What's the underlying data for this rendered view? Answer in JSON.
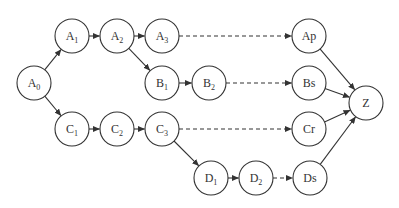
{
  "diagram": {
    "type": "directed-graph",
    "style": {
      "stroke_color": "#333333",
      "background": "#ffffff",
      "node_radius": 17
    },
    "nodes": [
      {
        "id": "A0",
        "base": "A",
        "sub": "0",
        "x": 34,
        "y": 83
      },
      {
        "id": "A1",
        "base": "A",
        "sub": "1",
        "x": 72,
        "y": 36
      },
      {
        "id": "A2",
        "base": "A",
        "sub": "2",
        "x": 117,
        "y": 36
      },
      {
        "id": "A3",
        "base": "A",
        "sub": "3",
        "x": 162,
        "y": 36
      },
      {
        "id": "B1",
        "base": "B",
        "sub": "1",
        "x": 162,
        "y": 83
      },
      {
        "id": "B2",
        "base": "B",
        "sub": "2",
        "x": 209,
        "y": 83
      },
      {
        "id": "C1",
        "base": "C",
        "sub": "1",
        "x": 72,
        "y": 129
      },
      {
        "id": "C2",
        "base": "C",
        "sub": "2",
        "x": 117,
        "y": 129
      },
      {
        "id": "C3",
        "base": "C",
        "sub": "3",
        "x": 162,
        "y": 129
      },
      {
        "id": "D1",
        "base": "D",
        "sub": "1",
        "x": 211,
        "y": 178
      },
      {
        "id": "D2",
        "base": "D",
        "sub": "2",
        "x": 256,
        "y": 178
      },
      {
        "id": "Ap",
        "base": "Ap",
        "sub": "",
        "x": 309,
        "y": 36
      },
      {
        "id": "Bs",
        "base": "Bs",
        "sub": "",
        "x": 309,
        "y": 83
      },
      {
        "id": "Cr",
        "base": "Cr",
        "sub": "",
        "x": 309,
        "y": 129
      },
      {
        "id": "Ds",
        "base": "Ds",
        "sub": "",
        "x": 310,
        "y": 178
      },
      {
        "id": "Z",
        "base": "Z",
        "sub": "",
        "x": 366,
        "y": 103
      }
    ],
    "edges": [
      {
        "from": "A0",
        "to": "A1",
        "style": "solid"
      },
      {
        "from": "A0",
        "to": "C1",
        "style": "solid"
      },
      {
        "from": "A1",
        "to": "A2",
        "style": "solid"
      },
      {
        "from": "A2",
        "to": "A3",
        "style": "solid"
      },
      {
        "from": "A2",
        "to": "B1",
        "style": "solid"
      },
      {
        "from": "A3",
        "to": "Ap",
        "style": "dashed"
      },
      {
        "from": "B1",
        "to": "B2",
        "style": "solid"
      },
      {
        "from": "B2",
        "to": "Bs",
        "style": "dashed"
      },
      {
        "from": "C1",
        "to": "C2",
        "style": "solid"
      },
      {
        "from": "C2",
        "to": "C3",
        "style": "solid"
      },
      {
        "from": "C3",
        "to": "Cr",
        "style": "dashed"
      },
      {
        "from": "C3",
        "to": "D1",
        "style": "solid"
      },
      {
        "from": "D1",
        "to": "D2",
        "style": "solid"
      },
      {
        "from": "D2",
        "to": "Ds",
        "style": "dashed"
      },
      {
        "from": "Ap",
        "to": "Z",
        "style": "solid"
      },
      {
        "from": "Bs",
        "to": "Z",
        "style": "solid"
      },
      {
        "from": "Cr",
        "to": "Z",
        "style": "solid"
      },
      {
        "from": "Ds",
        "to": "Z",
        "style": "solid"
      }
    ]
  }
}
